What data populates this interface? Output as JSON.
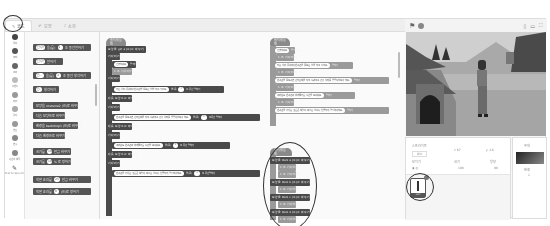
{
  "tabs": [
    {
      "label": "코드",
      "icon": "code-icon",
      "active": true
    },
    {
      "label": "모양",
      "icon": "brush-icon",
      "active": false
    },
    {
      "label": "소리",
      "icon": "speaker-icon",
      "active": false
    }
  ],
  "categories": [
    {
      "label": "동작"
    },
    {
      "label": "형태"
    },
    {
      "label": "소리"
    },
    {
      "label": "이벤트"
    },
    {
      "label": "제어"
    },
    {
      "label": "감지"
    },
    {
      "label": "연산"
    },
    {
      "label": "변수"
    },
    {
      "label": "나만의 블록"
    },
    {
      "label": "Text to Speech"
    }
  ],
  "palette_blocks": [
    {
      "text": "안녕! 을(를) 2 초 동안 말하기",
      "inputs": [
        "안녕!",
        "2"
      ]
    },
    {
      "text": "안녕! 말하기",
      "inputs": [
        "안녕!"
      ]
    },
    {
      "text": "음... 을(를) 2 초 동안 생각하기",
      "inputs": [
        "음...",
        "2"
      ]
    },
    {
      "text": "음... 생각하기",
      "inputs": [
        "음..."
      ]
    },
    {
      "text": "모양을 costume2 (으)로 바꾸기"
    },
    {
      "text": "다음 모양으로 바꾸기"
    },
    {
      "text": "배경을 backdrop1 (으)로 바꾸기"
    },
    {
      "text": "다음 배경으로 바꾸기"
    },
    {
      "text": "크기를 10 만큼 바꾸기"
    },
    {
      "text": "크기를 100 % 로 정하기"
    },
    {
      "text": "색깔 효과를 25 만큼 바꾸기"
    },
    {
      "text": "색깔 효과를 0 (으)로 정하기"
    }
  ],
  "scripts": {
    "script1": {
      "hat": "클릭했을 때",
      "blocks": [
        "모양을 girl-a (으)로 바꾸기",
        "기다리기",
        "안녕하세요 말하기",
        "1 초 기다리기",
        "기다리기",
        "저는 우리 동네에서 반려견을 돌보는 일을 하고 있어요. 을(를) 2 초 동안 말하기",
        "다음 모양으로 바꾸기",
        "기다리기",
        "반려견을 돌보려면 먼저 산책을 자주 시켜주고 건강 상태를 꼼꼼히 살펴야 해요. 을(를) 2 초 동안 말하기",
        "다음 모양으로 바꾸기",
        "기다리기",
        "여러분도 반려견과 함께 즐거운 시간을 보내세요. 을(를) 2 초 동안 말하기",
        "다음 모양으로 바꾸기",
        "기다리기",
        "반려견을 키우는 것은 큰 책임이 따르는 일이니 신중하게 결정해야 해요. 을(를) 2 초 동안 말하기"
      ]
    },
    "script2": {
      "hat": "클릭했을 때",
      "blocks": [
        "안녕하세요 말하기",
        "1 초 기다리기",
        "저는 우리 동네에서 반려견을 돌보는 일을 하고 있어요. 말하기",
        "1 초 기다리기",
        "반려견을 돌보려면 먼저 산책을 자주 시켜주고 건강 상태를 꼼꼼히 살펴야 해요. 말하기",
        "1 초 기다리기",
        "여러분도 반려견과 함께 즐거운 시간을 보내세요. 말하기",
        "1 초 기다리기",
        "반려견을 키우는 것은 큰 책임이 따르는 일이니 신중하게 결정해야 해요. 말하기"
      ]
    },
    "script3": {
      "hat": "클릭했을 때",
      "blocks": [
        "모양을 Dani-a (으)로 바꾸기",
        "1 초 기다리기",
        "1 초 기다리기",
        "모양을 Dani-b (으)로 바꾸기",
        "1 초 기다리기",
        "모양을 Dani-c (으)로 바꾸기",
        "1 초 기다리기",
        "모양을 Dani-d (으)로 바꾸기",
        "1 초 기다리기"
      ]
    }
  },
  "stage_header": {
    "green_flag": "green-flag-icon",
    "stop": "stop-icon",
    "layout_buttons": [
      "small-stage-icon",
      "large-stage-icon",
      "fullscreen-icon"
    ]
  },
  "sprite_info": {
    "sprite_label": "스프라이트",
    "sprite_name": "Girl",
    "x_label": "x",
    "x_value": "67",
    "y_label": "y",
    "y_value": "-18",
    "show_label": "보이기",
    "size_label": "크기",
    "size_value": "100",
    "direction_label": "방향",
    "direction_value": "90",
    "thumbnail_name": "Girl"
  },
  "stage_pane": {
    "title": "무대",
    "backdrops_label": "배경",
    "backdrops_count": "1"
  }
}
